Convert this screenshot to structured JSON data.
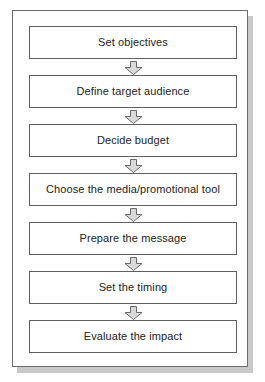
{
  "diagram": {
    "type": "vertical-flowchart",
    "frame": {
      "border_color": "#6d6d6d",
      "background": "#ffffff",
      "shadow_color": "#c8c8c8"
    },
    "box_style": {
      "fill": "#ffffff",
      "border_color": "#5f5f5f",
      "text_color": "#232323"
    },
    "connector_style": {
      "shape": "block-down-arrow",
      "fill": "#d9d9d9",
      "border_color": "#6b6b6b"
    },
    "steps": [
      {
        "index": 1,
        "label": "Set objectives"
      },
      {
        "index": 2,
        "label": "Define target audience"
      },
      {
        "index": 3,
        "label": "Decide budget"
      },
      {
        "index": 4,
        "label": "Choose the media/promotional tool"
      },
      {
        "index": 5,
        "label": "Prepare the message"
      },
      {
        "index": 6,
        "label": "Set the timing"
      },
      {
        "index": 7,
        "label": "Evaluate the impact"
      }
    ],
    "connectors": [
      {
        "index": 1,
        "from": "Set objectives",
        "to": "Define target audience",
        "icon": "down-arrow-icon"
      },
      {
        "index": 2,
        "from": "Define target audience",
        "to": "Decide budget",
        "icon": "down-arrow-icon"
      },
      {
        "index": 3,
        "from": "Decide budget",
        "to": "Choose the media/promotional tool",
        "icon": "down-arrow-icon"
      },
      {
        "index": 4,
        "from": "Choose the media/promotional tool",
        "to": "Prepare the message",
        "icon": "down-arrow-icon"
      },
      {
        "index": 5,
        "from": "Prepare the message",
        "to": "Set the timing",
        "icon": "down-arrow-icon"
      },
      {
        "index": 6,
        "from": "Set the timing",
        "to": "Evaluate the impact",
        "icon": "down-arrow-icon"
      }
    ]
  }
}
